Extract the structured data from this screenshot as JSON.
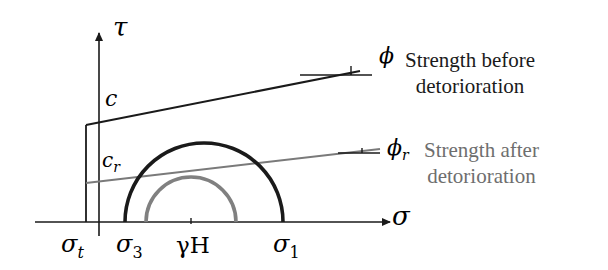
{
  "diagram": {
    "type": "mohr-coulomb-strength-envelope",
    "axes": {
      "y_label": "τ",
      "x_label": "σ"
    },
    "intercepts": {
      "cohesion_before": "c",
      "cohesion_after": "c",
      "cohesion_after_sub": "r"
    },
    "angles": {
      "phi": "ϕ",
      "phi_r": "ϕ",
      "phi_r_sub": "r"
    },
    "x_ticks": {
      "sigma_t": "σ",
      "sigma_t_sub": "t",
      "sigma_3": "σ",
      "sigma_3_sub": "3",
      "gamma_h": "γH",
      "sigma_1": "σ",
      "sigma_1_sub": "1"
    },
    "legend": {
      "before_line1": "Strength before",
      "before_line2": "detorioration",
      "after_line1": "Strength after",
      "after_line2": "detorioration"
    },
    "colors": {
      "before": "#1a1a1a",
      "after": "#7a7a7a",
      "after_text": "#6e6e6e"
    }
  }
}
